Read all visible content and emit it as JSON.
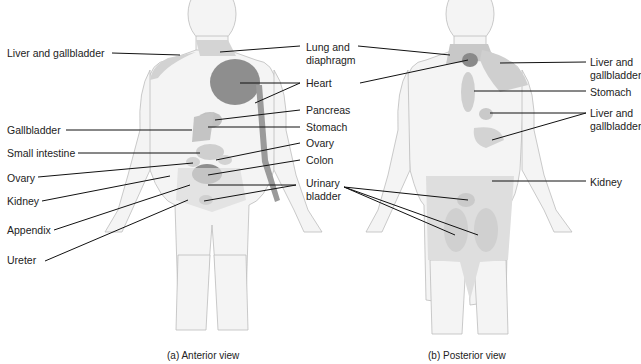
{
  "figure": {
    "panels": [
      {
        "id": "anterior",
        "caption": "(a) Anterior view",
        "labels": [
          {
            "text": "Liver and gallbladder",
            "x": 7,
            "y": 47
          },
          {
            "text": "Lung and\ndiaphragm",
            "x": 306,
            "y": 41
          },
          {
            "text": "Heart",
            "x": 306,
            "y": 77
          },
          {
            "text": "Pancreas",
            "x": 306,
            "y": 104
          },
          {
            "text": "Stomach",
            "x": 306,
            "y": 121
          },
          {
            "text": "Gallbladder",
            "x": 7,
            "y": 124
          },
          {
            "text": "Ovary",
            "x": 306,
            "y": 137
          },
          {
            "text": "Small intestine",
            "x": 7,
            "y": 147
          },
          {
            "text": "Colon",
            "x": 306,
            "y": 154
          },
          {
            "text": "Ovary",
            "x": 7,
            "y": 172
          },
          {
            "text": "Urinary\nbladder",
            "x": 306,
            "y": 177
          },
          {
            "text": "Kidney",
            "x": 7,
            "y": 195
          },
          {
            "text": "Appendix",
            "x": 7,
            "y": 224
          },
          {
            "text": "Ureter",
            "x": 7,
            "y": 254
          }
        ]
      },
      {
        "id": "posterior",
        "caption": "(b) Posterior view",
        "labels": [
          {
            "text": "Liver and\ngallbladder",
            "x": 590,
            "y": 56
          },
          {
            "text": "Stomach",
            "x": 590,
            "y": 86
          },
          {
            "text": "Liver and\ngallbladder",
            "x": 590,
            "y": 107
          },
          {
            "text": "Kidney",
            "x": 590,
            "y": 176
          }
        ]
      }
    ],
    "colors": {
      "body_fill": "#f4f4f4",
      "body_outline": "#bdbdbd",
      "light_region": "#d4d4d4",
      "mid_region": "#b9b9b9",
      "dark_region": "#8a8a8a",
      "leader_line": "#111111"
    }
  }
}
